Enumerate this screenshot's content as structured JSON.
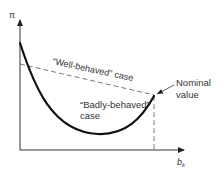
{
  "diagram": {
    "y_axis_label": "π",
    "x_axis_label": "b",
    "x_axis_subscript": "k",
    "well_behaved_label": "“Well-behaved” case",
    "badly_behaved_line1": "“Badly-behaved”",
    "badly_behaved_line2": "case",
    "nominal_line1": "Nominal",
    "nominal_line2": "value",
    "colors": {
      "curve": "#111111",
      "axis": "#333333",
      "dashed": "#555555",
      "text": "#333333"
    }
  }
}
